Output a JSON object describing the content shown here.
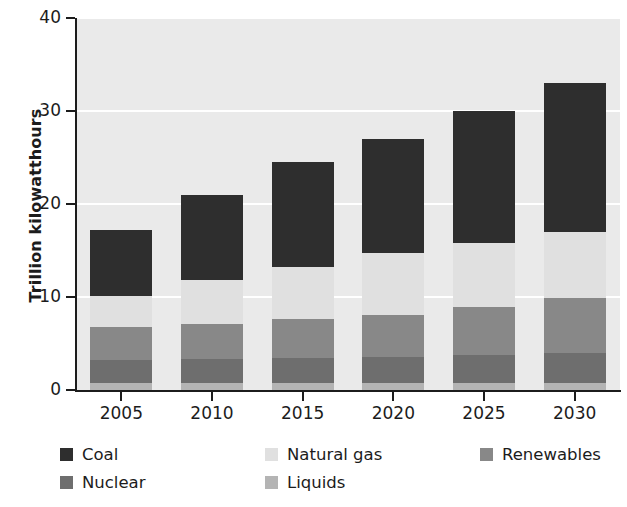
{
  "chart_data": {
    "type": "bar",
    "stacked": true,
    "title": "",
    "xlabel": "",
    "ylabel": "Trillion kilowatthours",
    "categories": [
      "2005",
      "2010",
      "2015",
      "2020",
      "2025",
      "2030"
    ],
    "ylim": [
      0,
      40
    ],
    "yticks": [
      0,
      10,
      20,
      30,
      40
    ],
    "ytick_labels": [
      "0",
      "10",
      "20",
      "30",
      "40"
    ],
    "grid": true,
    "grid_color": "#ffffff",
    "legend_position": "bottom",
    "plot_background": "#eaeaea",
    "series": [
      {
        "name": "Liquids",
        "color": "#b4b4b4",
        "values": [
          0.8,
          0.8,
          0.8,
          0.8,
          0.8,
          0.8
        ]
      },
      {
        "name": "Nuclear",
        "color": "#6e6e6e",
        "values": [
          2.4,
          2.5,
          2.6,
          2.8,
          3.0,
          3.2
        ]
      },
      {
        "name": "Renewables",
        "color": "#888888",
        "values": [
          3.6,
          3.8,
          4.2,
          4.5,
          5.1,
          5.9
        ]
      },
      {
        "name": "Natural gas",
        "color": "#e0e0e0",
        "values": [
          3.3,
          4.7,
          5.6,
          6.6,
          6.9,
          7.1
        ]
      },
      {
        "name": "Coal",
        "color": "#2e2e2e",
        "values": [
          7.1,
          9.2,
          11.3,
          12.3,
          14.2,
          16.0
        ]
      }
    ],
    "totals": [
      17.2,
      21.0,
      24.5,
      27.0,
      30.0,
      33.0
    ],
    "stack_tops": {
      "liquids": [
        0.8,
        0.8,
        0.8,
        0.8,
        0.8,
        0.8
      ],
      "nuclear": [
        3.2,
        3.3,
        3.4,
        3.6,
        3.8,
        4.0
      ],
      "renewables": [
        6.8,
        7.1,
        7.6,
        8.1,
        8.9,
        9.9
      ],
      "natural_gas": [
        10.1,
        11.8,
        13.2,
        14.7,
        15.8,
        17.0
      ],
      "coal": [
        17.2,
        21.0,
        24.5,
        27.0,
        30.0,
        33.0
      ]
    }
  },
  "legend": {
    "entries": [
      {
        "label": "Coal",
        "color": "#2e2e2e"
      },
      {
        "label": "Natural gas",
        "color": "#e0e0e0"
      },
      {
        "label": "Renewables",
        "color": "#888888"
      },
      {
        "label": "Nuclear",
        "color": "#6e6e6e"
      },
      {
        "label": "Liquids",
        "color": "#b4b4b4"
      }
    ]
  }
}
